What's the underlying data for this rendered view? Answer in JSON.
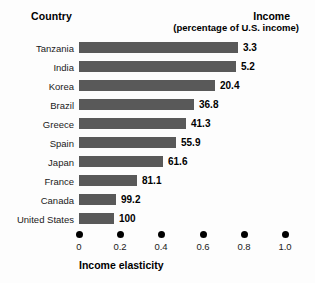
{
  "header": {
    "country_label": "Country",
    "income_label": "Income",
    "income_sublabel": "(percentage of U.S. income)"
  },
  "axis": {
    "title": "Income elasticity",
    "ticks": [
      "0",
      "0.2",
      "0.4",
      "0.6",
      "0.8",
      "1.0"
    ]
  },
  "chart_data": {
    "type": "bar",
    "orientation": "horizontal",
    "title": "",
    "xlabel": "Income elasticity",
    "ylabel": "Country",
    "xlim": [
      0,
      1.0
    ],
    "xticks": [
      0,
      0.2,
      0.4,
      0.6,
      0.8,
      1.0
    ],
    "grid": false,
    "legend": false,
    "bar_color": "#595959",
    "value_label_header": "Income (percentage of U.S. income)",
    "categories": [
      "Tanzania",
      "India",
      "Korea",
      "Brazil",
      "Greece",
      "Spain",
      "Japan",
      "France",
      "Canada",
      "United States"
    ],
    "values": [
      0.77,
      0.76,
      0.66,
      0.56,
      0.52,
      0.47,
      0.41,
      0.28,
      0.18,
      0.17
    ],
    "data_labels": [
      "3.3",
      "5.2",
      "20.4",
      "36.8",
      "41.3",
      "55.9",
      "61.6",
      "81.1",
      "99.2",
      "100"
    ],
    "rows": [
      {
        "country": "Tanzania",
        "elasticity": 0.77,
        "income_pct": "3.3"
      },
      {
        "country": "India",
        "elasticity": 0.76,
        "income_pct": "5.2"
      },
      {
        "country": "Korea",
        "elasticity": 0.66,
        "income_pct": "20.4"
      },
      {
        "country": "Brazil",
        "elasticity": 0.56,
        "income_pct": "36.8"
      },
      {
        "country": "Greece",
        "elasticity": 0.52,
        "income_pct": "41.3"
      },
      {
        "country": "Spain",
        "elasticity": 0.47,
        "income_pct": "55.9"
      },
      {
        "country": "Japan",
        "elasticity": 0.41,
        "income_pct": "61.6"
      },
      {
        "country": "France",
        "elasticity": 0.28,
        "income_pct": "81.1"
      },
      {
        "country": "Canada",
        "elasticity": 0.18,
        "income_pct": "99.2"
      },
      {
        "country": "United States",
        "elasticity": 0.17,
        "income_pct": "100"
      }
    ]
  }
}
